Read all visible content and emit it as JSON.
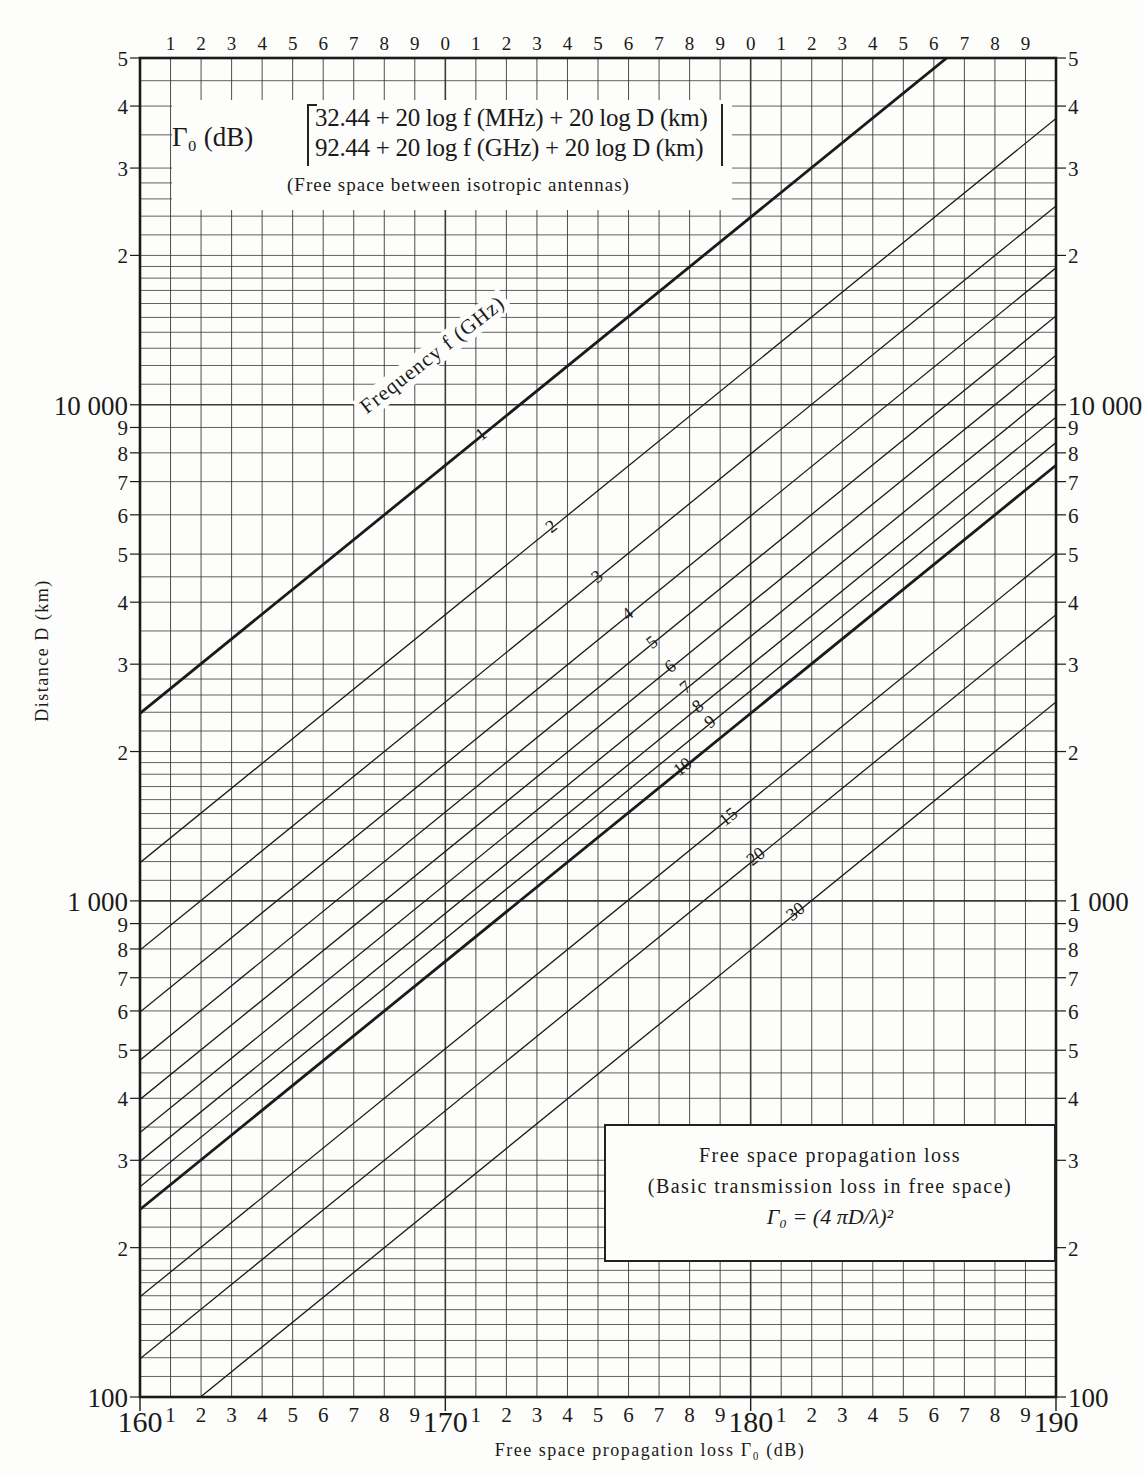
{
  "formula_box": {
    "gamma_label": "Γ₀ (dB)",
    "line1": "32.44 + 20 log f (MHz) + 20 log D (km)",
    "line2": "92.44 + 20 log f (GHz) + 20 log D (km)",
    "note": "(Free space between isotropic antennas)"
  },
  "info_box": {
    "title": "Free space propagation loss",
    "subtitle": "(Basic transmission loss in free space)",
    "formula": "Γ₀ = (4 πD/λ)²"
  },
  "axes": {
    "xlabel": "Free space propagation loss Γ₀ (dB)",
    "ylabel": "Distance D (km)",
    "frequency_title": "Frequency f (GHz)"
  },
  "chart_data": {
    "type": "line",
    "title": "Free space propagation loss (Basic transmission loss in free space)",
    "xlabel": "Free space propagation loss Γ0 (dB)",
    "ylabel": "Distance D (km)",
    "xlim": [
      160,
      190
    ],
    "ylim": [
      100,
      50000
    ],
    "yscale": "log",
    "grid": true,
    "x_major_ticks": [
      160,
      170,
      180,
      190
    ],
    "x_minor_tick_labels": [
      "1",
      "2",
      "3",
      "4",
      "5",
      "6",
      "7",
      "8",
      "9"
    ],
    "top_tick_labels": [
      "1",
      "2",
      "3",
      "4",
      "5",
      "6",
      "7",
      "8",
      "9",
      "0",
      "1",
      "2",
      "3",
      "4",
      "5",
      "6",
      "7",
      "8",
      "9"
    ],
    "y_major_ticks": [
      100,
      1000,
      10000
    ],
    "y_major_tick_labels": [
      "100",
      "1 000",
      "10 000"
    ],
    "y_minor_tick_labels": [
      "2",
      "3",
      "4",
      "5",
      "6",
      "7",
      "8",
      "9"
    ],
    "y_top_label": "5",
    "relation": "Γ0 = 92.44 + 20 log f(GHz) + 20 log D(km)",
    "series_parameter": "Frequency f (GHz)",
    "series": [
      {
        "name": "1",
        "f_ghz": 1,
        "bold": true,
        "label_at_db": 171.2
      },
      {
        "name": "2",
        "f_ghz": 2,
        "bold": false,
        "label_at_db": 173.5
      },
      {
        "name": "3",
        "f_ghz": 3,
        "bold": false,
        "label_at_db": 175.0
      },
      {
        "name": "4",
        "f_ghz": 4,
        "bold": false,
        "label_at_db": 176.0
      },
      {
        "name": "5",
        "f_ghz": 5,
        "bold": false,
        "label_at_db": 176.8
      },
      {
        "name": "6",
        "f_ghz": 6,
        "bold": false,
        "label_at_db": 177.4
      },
      {
        "name": "7",
        "f_ghz": 7,
        "bold": false,
        "label_at_db": 177.9
      },
      {
        "name": "8",
        "f_ghz": 8,
        "bold": false,
        "label_at_db": 178.3
      },
      {
        "name": "9",
        "f_ghz": 9,
        "bold": false,
        "label_at_db": 178.7
      },
      {
        "name": "10",
        "f_ghz": 10,
        "bold": true,
        "label_at_db": 177.8
      },
      {
        "name": "15",
        "f_ghz": 15,
        "bold": false,
        "label_at_db": 179.3
      },
      {
        "name": "20",
        "f_ghz": 20,
        "bold": false,
        "label_at_db": 180.2
      },
      {
        "name": "30",
        "f_ghz": 30,
        "bold": false,
        "label_at_db": 181.5
      }
    ],
    "sample_points": [
      {
        "f_ghz": 1,
        "loss_db": 160,
        "distance_km": 2388
      },
      {
        "f_ghz": 1,
        "loss_db": 186.4,
        "distance_km": 50000
      },
      {
        "f_ghz": 10,
        "loss_db": 160,
        "distance_km": 239
      },
      {
        "f_ghz": 10,
        "loss_db": 190,
        "distance_km": 7550
      },
      {
        "f_ghz": 30,
        "loss_db": 170,
        "distance_km": 265
      },
      {
        "f_ghz": 30,
        "loss_db": 190,
        "distance_km": 2517
      }
    ]
  },
  "colors": {
    "ink": "#1a1a1a",
    "paper": "#fdfdfb",
    "grid": "#3a3a3a"
  }
}
